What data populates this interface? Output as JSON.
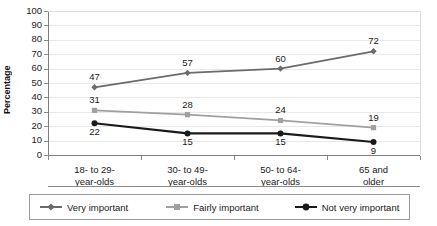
{
  "chart_data": {
    "type": "line",
    "title": "",
    "xlabel": "",
    "ylabel": "Percentage",
    "ylim": [
      0,
      100
    ],
    "ytick_step": 10,
    "grid": true,
    "legend_position": "bottom",
    "categories": [
      "18- to 29-\nyear-olds",
      "30- to 49-\nyear-olds",
      "50- to 64-\nyear-olds",
      "65 and\nolder"
    ],
    "yticks": [
      "100",
      "90",
      "80",
      "70",
      "60",
      "50",
      "40",
      "30",
      "20",
      "10",
      "0"
    ],
    "series": [
      {
        "name": "Very important",
        "marker": "diamond",
        "color": "#6b6b6b",
        "values": [
          47,
          57,
          60,
          72
        ],
        "label_positions": [
          "above",
          "above",
          "above",
          "above"
        ]
      },
      {
        "name": "Fairly important",
        "marker": "square",
        "color": "#a0a0a0",
        "values": [
          31,
          28,
          24,
          19
        ],
        "label_positions": [
          "above",
          "above",
          "above",
          "above"
        ]
      },
      {
        "name": "Not very important",
        "marker": "circle",
        "color": "#1a1a1a",
        "values": [
          22,
          15,
          15,
          9
        ],
        "label_positions": [
          "below",
          "below",
          "below",
          "below"
        ]
      }
    ]
  },
  "axis": {
    "ylabel": "Percentage"
  },
  "legend": {
    "items": [
      {
        "label": "Very important"
      },
      {
        "label": "Fairly important"
      },
      {
        "label": "Not very important"
      }
    ]
  }
}
